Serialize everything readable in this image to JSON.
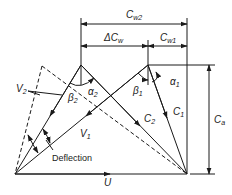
{
  "diagram": {
    "labels": {
      "cw2": {
        "base": "C",
        "sub": "w2"
      },
      "dcw": {
        "prefix": "Δ",
        "base": "C",
        "sub": "w"
      },
      "cw1": {
        "base": "C",
        "sub": "w1"
      },
      "ca": {
        "base": "C",
        "sub": "a"
      },
      "alpha1": {
        "base": "α",
        "sub": "1"
      },
      "alpha2": {
        "base": "α",
        "sub": "2"
      },
      "beta1": {
        "base": "β",
        "sub": "1"
      },
      "beta2": {
        "base": "β",
        "sub": "2"
      },
      "v1": {
        "base": "V",
        "sub": "1"
      },
      "v2": {
        "base": "V",
        "sub": "2"
      },
      "c1": {
        "base": "C",
        "sub": "1"
      },
      "c2": {
        "base": "C",
        "sub": "2"
      },
      "u": {
        "base": "U"
      },
      "deflection": "Deflection"
    },
    "colors": {
      "line": "#1a1a1a",
      "background": "#ffffff"
    }
  }
}
